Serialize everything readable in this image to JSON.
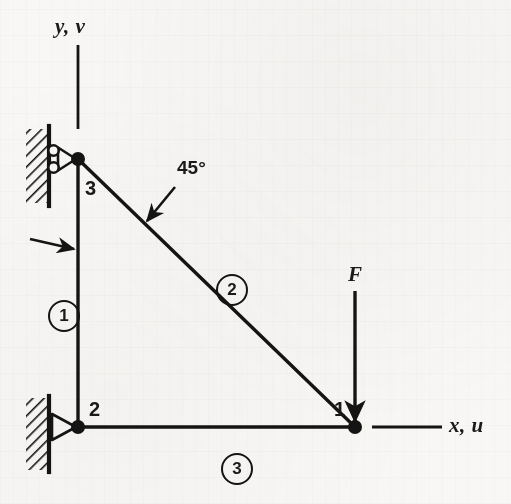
{
  "figure": {
    "kind": "structural-truss-diagram",
    "background_color": "#f8f7f5",
    "ink_color": "#141414"
  },
  "axes": {
    "y_label": "y, v",
    "x_label": "x, u"
  },
  "nodes": [
    {
      "id": "node-1",
      "label": "1",
      "x": 355,
      "y": 427
    },
    {
      "id": "node-2",
      "label": "2",
      "x": 78,
      "y": 427
    },
    {
      "id": "node-3",
      "label": "3",
      "x": 78,
      "y": 159
    }
  ],
  "members": [
    {
      "id": "member-1",
      "label": "1",
      "from": "node-3",
      "to": "node-2",
      "badge_x": 48,
      "badge_y": 300
    },
    {
      "id": "member-2",
      "label": "2",
      "from": "node-3",
      "to": "node-1",
      "badge_x": 216,
      "badge_y": 274
    },
    {
      "id": "member-3",
      "label": "3",
      "from": "node-2",
      "to": "node-1",
      "badge_x": 221,
      "badge_y": 453
    }
  ],
  "annotations": {
    "angle": "45°",
    "force": "F"
  },
  "supports": [
    {
      "id": "support-roller",
      "type": "roller",
      "at": "node-3"
    },
    {
      "id": "support-pin",
      "type": "pin",
      "at": "node-2"
    }
  ]
}
